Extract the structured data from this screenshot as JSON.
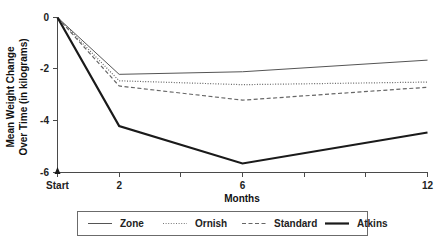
{
  "chart_data": {
    "type": "line",
    "title": "",
    "xlabel": "Months",
    "ylabel": "Mean Weight Change Over Time (in kilograms)",
    "ylabel_line1": "Mean Weight Change",
    "ylabel_line2": "Over Time (in kilograms)",
    "x": [
      0,
      2,
      6,
      12
    ],
    "x_tick_values": [
      0,
      2,
      4,
      6,
      8,
      10,
      12
    ],
    "x_tick_labels": [
      "Start",
      "2",
      "",
      "6",
      "",
      "",
      "12"
    ],
    "y_tick_values": [
      0,
      -2,
      -4,
      -6
    ],
    "y_tick_labels": [
      "0",
      "-2",
      "-4",
      "-6"
    ],
    "xlim": [
      0,
      12
    ],
    "ylim": [
      -6,
      0
    ],
    "grid": false,
    "legend_position": "bottom",
    "series": [
      {
        "name": "Zone",
        "style": "solid-thin",
        "color": "#555555",
        "values": [
          0,
          -2.2,
          -2.1,
          -1.65
        ]
      },
      {
        "name": "Ornish",
        "style": "dotted",
        "color": "#666666",
        "values": [
          0,
          -2.45,
          -2.6,
          -2.5
        ]
      },
      {
        "name": "Standard",
        "style": "dashed",
        "color": "#666666",
        "values": [
          0,
          -2.65,
          -3.2,
          -2.7
        ]
      },
      {
        "name": "Atkins",
        "style": "solid-thick",
        "color": "#1a1a1a",
        "values": [
          0,
          -4.2,
          -5.65,
          -4.45
        ]
      }
    ]
  },
  "legend": {
    "items": [
      {
        "label": "Zone"
      },
      {
        "label": "Ornish"
      },
      {
        "label": "Standard"
      },
      {
        "label": "Atkins"
      }
    ]
  },
  "axes": {
    "x_title": "Months",
    "y_title_line1": "Mean Weight Change",
    "y_title_line2": "Over Time (in kilograms)"
  }
}
